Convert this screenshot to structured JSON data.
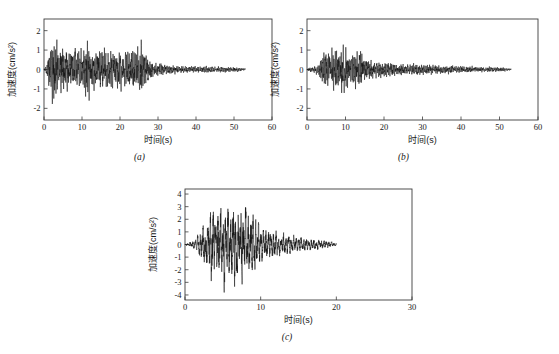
{
  "figure": {
    "background": "#ffffff",
    "trace_color": "#111111",
    "axis_color": "#3c3c3c",
    "panel_count": 3
  },
  "chart_data": [
    {
      "type": "line",
      "panel_id": "a",
      "caption": "(a)",
      "title": "",
      "xlabel": "时间(s)",
      "ylabel": "加速度(cm/s²)",
      "xlim": [
        0,
        60
      ],
      "ylim": [
        -2.6,
        2.6
      ],
      "xticks": [
        0,
        10,
        20,
        30,
        40,
        50,
        60
      ],
      "xticklabels": [
        "0",
        "10",
        "20",
        "30",
        "40",
        "50",
        "60"
      ],
      "yticks": [
        -2,
        -1,
        0,
        1,
        2
      ],
      "yticklabels": [
        "-2",
        "-1",
        "0",
        "1",
        "2"
      ],
      "grid": false,
      "legend": "none",
      "series_name": "加速度时程",
      "record_duration_s": 53,
      "peak_positive": 2.15,
      "peak_negative": -2.05,
      "peak_time_s": 2.6,
      "envelope_description": "Strong shaking from 1 to 27 s with peaks near 2 cm/s^2, decaying coda to 53 s",
      "envelope_points": [
        {
          "t": 0.0,
          "a": 0.02
        },
        {
          "t": 0.8,
          "a": 0.35
        },
        {
          "t": 1.6,
          "a": 1.35
        },
        {
          "t": 2.6,
          "a": 2.15
        },
        {
          "t": 3.6,
          "a": 1.35
        },
        {
          "t": 4.6,
          "a": 1.55
        },
        {
          "t": 6.0,
          "a": 1.25
        },
        {
          "t": 7.5,
          "a": 1.3
        },
        {
          "t": 9.0,
          "a": 1.1
        },
        {
          "t": 10.5,
          "a": 1.2
        },
        {
          "t": 11.5,
          "a": 1.75
        },
        {
          "t": 12.5,
          "a": 1.2
        },
        {
          "t": 14.0,
          "a": 1.05
        },
        {
          "t": 16.0,
          "a": 1.2
        },
        {
          "t": 18.0,
          "a": 1.05
        },
        {
          "t": 20.0,
          "a": 1.15
        },
        {
          "t": 22.0,
          "a": 1.0
        },
        {
          "t": 24.0,
          "a": 1.3
        },
        {
          "t": 25.5,
          "a": 1.45
        },
        {
          "t": 27.0,
          "a": 0.8
        },
        {
          "t": 29.0,
          "a": 0.4
        },
        {
          "t": 32.0,
          "a": 0.28
        },
        {
          "t": 36.0,
          "a": 0.22
        },
        {
          "t": 41.0,
          "a": 0.18
        },
        {
          "t": 46.0,
          "a": 0.17
        },
        {
          "t": 50.0,
          "a": 0.16
        },
        {
          "t": 53.0,
          "a": 0.08
        }
      ]
    },
    {
      "type": "line",
      "panel_id": "b",
      "caption": "(b)",
      "title": "",
      "xlabel": "时间(s)",
      "ylabel": "加速度(cm/s²)",
      "xlim": [
        0,
        60
      ],
      "ylim": [
        -2.6,
        2.6
      ],
      "xticks": [
        0,
        10,
        20,
        30,
        40,
        50,
        60
      ],
      "xticklabels": [
        "0",
        "10",
        "20",
        "30",
        "40",
        "50",
        "60"
      ],
      "yticks": [
        -2,
        -1,
        0,
        1,
        2
      ],
      "yticklabels": [
        "-2",
        "-1",
        "0",
        "1",
        "2"
      ],
      "grid": false,
      "legend": "none",
      "series_name": "加速度时程",
      "record_duration_s": 53,
      "peak_positive": 1.45,
      "peak_negative": -1.55,
      "peak_time_s": 9.6,
      "envelope_description": "Quiet first 3 s, strongest burst between 4 and 15 s peaking near 1.5 cm/s^2, slow decay to 53 s",
      "envelope_points": [
        {
          "t": 0.0,
          "a": 0.02
        },
        {
          "t": 1.0,
          "a": 0.18
        },
        {
          "t": 2.0,
          "a": 0.22
        },
        {
          "t": 3.0,
          "a": 0.3
        },
        {
          "t": 4.0,
          "a": 0.95
        },
        {
          "t": 5.0,
          "a": 1.1
        },
        {
          "t": 6.0,
          "a": 0.85
        },
        {
          "t": 7.0,
          "a": 1.25
        },
        {
          "t": 8.0,
          "a": 1.1
        },
        {
          "t": 9.0,
          "a": 1.3
        },
        {
          "t": 9.6,
          "a": 1.55
        },
        {
          "t": 10.5,
          "a": 1.05
        },
        {
          "t": 11.5,
          "a": 0.8
        },
        {
          "t": 12.5,
          "a": 1.05
        },
        {
          "t": 13.5,
          "a": 1.2
        },
        {
          "t": 14.5,
          "a": 0.95
        },
        {
          "t": 16.0,
          "a": 0.55
        },
        {
          "t": 18.0,
          "a": 0.45
        },
        {
          "t": 20.0,
          "a": 0.4
        },
        {
          "t": 23.0,
          "a": 0.35
        },
        {
          "t": 26.0,
          "a": 0.33
        },
        {
          "t": 30.0,
          "a": 0.3
        },
        {
          "t": 34.0,
          "a": 0.26
        },
        {
          "t": 38.0,
          "a": 0.22
        },
        {
          "t": 42.0,
          "a": 0.18
        },
        {
          "t": 46.0,
          "a": 0.15
        },
        {
          "t": 50.0,
          "a": 0.13
        },
        {
          "t": 53.0,
          "a": 0.07
        }
      ]
    },
    {
      "type": "line",
      "panel_id": "c",
      "caption": "(c)",
      "title": "",
      "xlabel": "时间(s)",
      "ylabel": "加速度(cm/s²)",
      "xlim": [
        0,
        30
      ],
      "ylim": [
        -4.4,
        4.4
      ],
      "xticks": [
        0,
        10,
        20,
        30
      ],
      "xticklabels": [
        "0",
        "10",
        "20",
        "30"
      ],
      "yticks": [
        -4,
        -3,
        -2,
        -1,
        0,
        1,
        2,
        3,
        4
      ],
      "yticklabels": [
        "-4",
        "-3",
        "-2",
        "-1",
        "0",
        "1",
        "2",
        "3",
        "4"
      ],
      "grid": false,
      "legend": "none",
      "series_name": "加速度时程",
      "record_duration_s": 20,
      "peak_positive": 3.55,
      "peak_negative": -3.25,
      "peak_time_s": 6.4,
      "envelope_description": "Rapid build-up after 2 s, strong motion 3 to 9 s with peaks above 3 cm/s^2, decay to 20 s",
      "envelope_points": [
        {
          "t": 0.0,
          "a": 0.03
        },
        {
          "t": 0.8,
          "a": 0.25
        },
        {
          "t": 1.5,
          "a": 0.55
        },
        {
          "t": 2.2,
          "a": 1.3
        },
        {
          "t": 3.0,
          "a": 2.4
        },
        {
          "t": 3.6,
          "a": 3.25
        },
        {
          "t": 4.2,
          "a": 2.6
        },
        {
          "t": 4.8,
          "a": 3.1
        },
        {
          "t": 5.4,
          "a": 3.4
        },
        {
          "t": 6.0,
          "a": 2.7
        },
        {
          "t": 6.4,
          "a": 3.55
        },
        {
          "t": 7.0,
          "a": 2.9
        },
        {
          "t": 7.6,
          "a": 3.1
        },
        {
          "t": 8.2,
          "a": 2.6
        },
        {
          "t": 8.8,
          "a": 3.0
        },
        {
          "t": 9.4,
          "a": 2.0
        },
        {
          "t": 10.2,
          "a": 1.45
        },
        {
          "t": 11.0,
          "a": 1.25
        },
        {
          "t": 12.0,
          "a": 1.05
        },
        {
          "t": 13.0,
          "a": 0.9
        },
        {
          "t": 14.0,
          "a": 0.8
        },
        {
          "t": 15.0,
          "a": 0.65
        },
        {
          "t": 16.0,
          "a": 0.55
        },
        {
          "t": 17.0,
          "a": 0.45
        },
        {
          "t": 18.0,
          "a": 0.38
        },
        {
          "t": 19.0,
          "a": 0.32
        },
        {
          "t": 20.0,
          "a": 0.1
        }
      ]
    }
  ]
}
